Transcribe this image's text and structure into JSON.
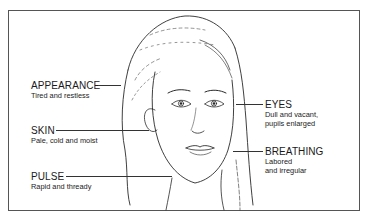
{
  "figure": {
    "labels_left": [
      {
        "title": "APPEARANCE",
        "desc": [
          "Tired and restless"
        ]
      },
      {
        "title": "SKIN",
        "desc": [
          "Pale, cold and moist"
        ]
      },
      {
        "title": "PULSE",
        "desc": [
          "Rapid and thready"
        ]
      }
    ],
    "labels_right": [
      {
        "title": "EYES",
        "desc": [
          "Dull and vacant,",
          "pupils enlarged"
        ]
      },
      {
        "title": "BREATHING",
        "desc": [
          "Labored",
          "and irregular"
        ]
      }
    ],
    "colors": {
      "ink": "#1a1a1a",
      "frame": "#555555",
      "background": "#ffffff"
    }
  }
}
